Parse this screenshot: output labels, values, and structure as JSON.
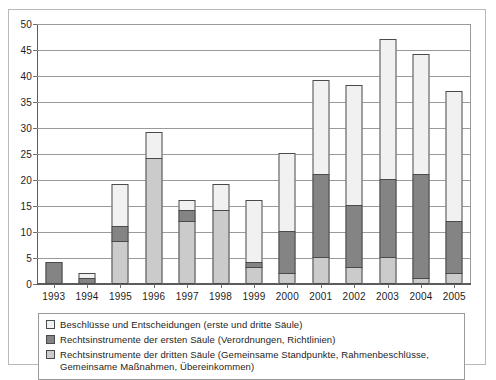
{
  "chart_data": {
    "type": "bar",
    "stacked": true,
    "title": "",
    "subtitle": "",
    "xlabel": "",
    "ylabel": "",
    "ylim": [
      0,
      50
    ],
    "ytick_step": 5,
    "yticks": [
      0,
      5,
      10,
      15,
      20,
      25,
      30,
      35,
      40,
      45,
      50
    ],
    "grid": true,
    "grid_axis": "y",
    "legend_position": "bottom",
    "categories": [
      "1993",
      "1994",
      "1995",
      "1996",
      "1997",
      "1998",
      "1999",
      "2000",
      "2001",
      "2002",
      "2003",
      "2004",
      "2005"
    ],
    "series": [
      {
        "name": "Rechtsinstrumente der dritten Säule (Gemeinsame Standpunkte, Rahmenbeschlüsse, Gemeinsame Maßnahmen, Übereinkommen)",
        "key": "third_pillar",
        "color": "#cbcbcb",
        "values": [
          0,
          0,
          8,
          24,
          12,
          14,
          3,
          2,
          5,
          3,
          5,
          1,
          2
        ]
      },
      {
        "name": "Rechtsinstrumente der ersten Säule (Verordnungen, Richtlinien)",
        "key": "first_pillar",
        "color": "#848484",
        "values": [
          4,
          1,
          3,
          0,
          2,
          0,
          1,
          8,
          16,
          12,
          15,
          20,
          10
        ]
      },
      {
        "name": "Beschlüsse und Entscheidungen (erste und dritte Säule)",
        "key": "decisions",
        "color": "#f1f1f1",
        "values": [
          0,
          1,
          8,
          5,
          2,
          5,
          12,
          15,
          18,
          23,
          27,
          23,
          25
        ]
      }
    ],
    "totals": [
      4,
      2,
      19,
      29,
      16,
      19,
      16,
      25,
      39,
      38,
      47,
      44,
      37
    ]
  },
  "legend": {
    "items": [
      {
        "swatch": "sw-dec",
        "label": "Beschlüsse und Entscheidungen (erste und dritte Säule)"
      },
      {
        "swatch": "sw-first",
        "label": "Rechtsinstrumente der ersten Säule (Verordnungen, Richtlinien)"
      },
      {
        "swatch": "sw-third",
        "label": "Rechtsinstrumente der dritten Säule (Gemeinsame Standpunkte, Rahmenbeschlüsse, Gemeinsame Maßnahmen, Übereinkommen)"
      }
    ]
  },
  "colors": {
    "third_pillar": "#cbcbcb",
    "first_pillar": "#848484",
    "decisions": "#f1f1f1",
    "grid": "#9a9a9a",
    "axis": "#5c5c5c",
    "text": "#1d1d1d",
    "frame": "#b9b9b9"
  }
}
